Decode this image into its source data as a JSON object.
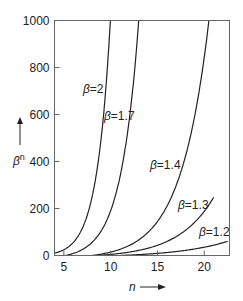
{
  "chart_data": {
    "type": "line",
    "title": "",
    "xlabel": "n",
    "ylabel": "β^n",
    "xlim": [
      4,
      22.7
    ],
    "ylim": [
      0,
      1000
    ],
    "x_ticks": [
      5,
      10,
      15,
      20
    ],
    "y_ticks": [
      0,
      200,
      400,
      600,
      800,
      1000
    ],
    "grid": false,
    "series": [
      {
        "name": "β=2",
        "base": 2,
        "n_start": 4,
        "n_end": 9.97
      },
      {
        "name": "β=1.7",
        "base": 1.7,
        "n_start": 5.2,
        "n_end": 13.0
      },
      {
        "name": "β=1.4",
        "base": 1.4,
        "n_start": 8.0,
        "n_end": 20.5
      },
      {
        "name": "β=1.3",
        "base": 1.3,
        "n_start": 8.5,
        "n_end": 21.0
      },
      {
        "name": "β=1.2",
        "base": 1.2,
        "n_start": 11.0,
        "n_end": 22.5
      }
    ],
    "labels": {
      "x_axis": "n",
      "y_axis_base": "β",
      "y_axis_exp": "n"
    }
  }
}
